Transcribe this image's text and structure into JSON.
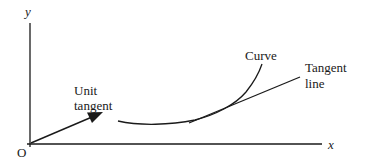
{
  "diagram": {
    "axes": {
      "x_label": "x",
      "y_label": "y",
      "origin_label": "O"
    },
    "labels": {
      "unit_tangent_line1": "Unit",
      "unit_tangent_line2": "tangent",
      "curve": "Curve",
      "tangent_line1": "Tangent",
      "tangent_line2": "line"
    },
    "colors": {
      "stroke": "#1a1a1a",
      "background": "#ffffff"
    }
  }
}
